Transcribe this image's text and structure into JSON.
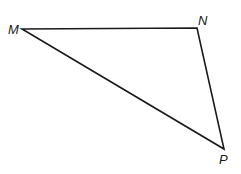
{
  "diagram": {
    "type": "triangle",
    "stroke_color": "#1a1a1a",
    "vertices": [
      {
        "label": "M",
        "x": 22,
        "y": 29
      },
      {
        "label": "N",
        "x": 197,
        "y": 28
      },
      {
        "label": "P",
        "x": 224,
        "y": 149
      }
    ],
    "labels": {
      "M": "M",
      "N": "N",
      "P": "P"
    }
  }
}
